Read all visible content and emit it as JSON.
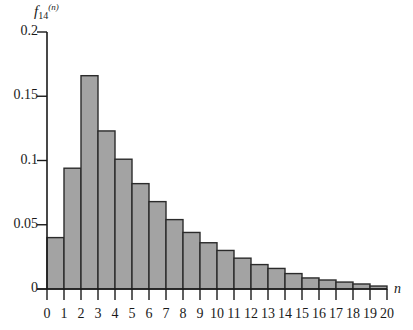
{
  "chart_data": {
    "type": "bar",
    "title": "",
    "ylabel": "f14(n)",
    "ylabel_parts": {
      "base": "f",
      "sub": "14",
      "sup": "(n)"
    },
    "xlabel": "n",
    "categories": [
      "0",
      "1",
      "2",
      "3",
      "4",
      "5",
      "6",
      "7",
      "8",
      "9",
      "10",
      "11",
      "12",
      "13",
      "14",
      "15",
      "16",
      "17",
      "18",
      "19"
    ],
    "x_tick_labels": [
      "0",
      "1",
      "2",
      "3",
      "4",
      "5",
      "6",
      "7",
      "8",
      "9",
      "10",
      "11",
      "12",
      "13",
      "14",
      "15",
      "16",
      "17",
      "18",
      "19",
      "20"
    ],
    "values": [
      0.04,
      0.094,
      0.166,
      0.123,
      0.101,
      0.082,
      0.068,
      0.054,
      0.044,
      0.036,
      0.03,
      0.024,
      0.019,
      0.016,
      0.012,
      0.0086,
      0.007,
      0.0054,
      0.0039,
      0.0023
    ],
    "y_ticks": [
      0,
      0.05,
      0.1,
      0.15,
      0.2
    ],
    "y_tick_labels": [
      "0",
      "0.05",
      "0.1",
      "0.15",
      "0.2"
    ],
    "ylim": [
      0,
      0.2
    ],
    "xlim": [
      0,
      20
    ],
    "grid": false,
    "legend": null,
    "colors": {
      "bar_fill": "#a3a3a3",
      "bar_edge": "#2b2b2b",
      "axis": "#1a1a1a"
    }
  }
}
